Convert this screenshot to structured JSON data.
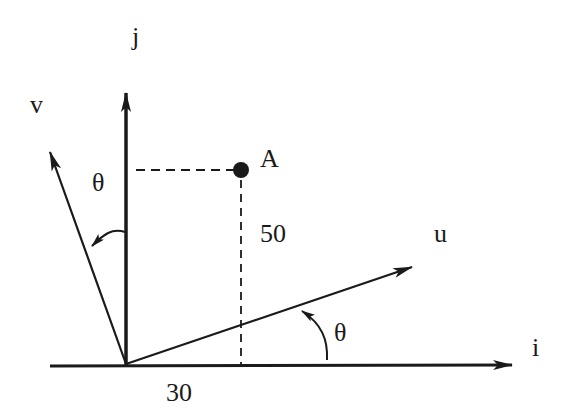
{
  "diagram": {
    "type": "coordinate-rotation",
    "colors": {
      "ink": "#1a1a1a",
      "background": "#ffffff"
    },
    "axes": {
      "i": {
        "label": "i"
      },
      "j": {
        "label": "j"
      },
      "u": {
        "label": "u"
      },
      "v": {
        "label": "v"
      }
    },
    "point": {
      "label": "A"
    },
    "dimensions": {
      "horizontal": "30",
      "vertical": "50"
    },
    "angles": {
      "uv_to_ij": "θ",
      "v_to_j": "θ"
    }
  }
}
